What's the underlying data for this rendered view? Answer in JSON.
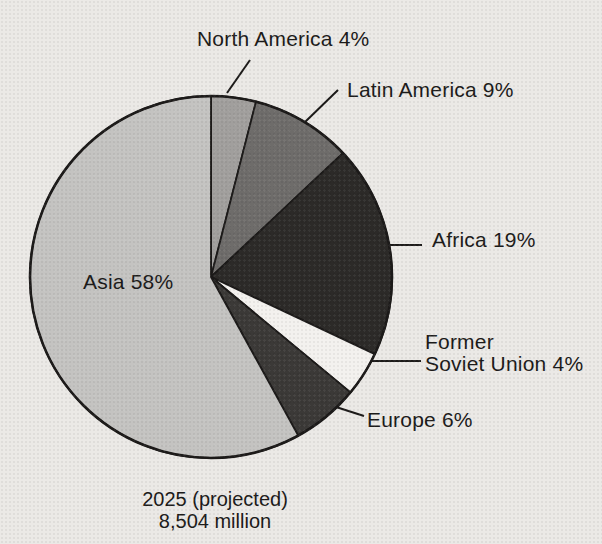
{
  "page": {
    "background_color": "#ebe9e6",
    "text_color": "#1b1a19"
  },
  "chart_data": {
    "type": "pie",
    "title": "",
    "caption_line1": "2025 (projected)",
    "caption_line2": "8,504 million",
    "year": 2025,
    "total_million": 8504,
    "direction": "clockwise",
    "start_angle_deg_from_top": 0,
    "stroke_color": "#1c1a19",
    "slices": [
      {
        "id": "north-america",
        "name": "North America",
        "value_pct": 4,
        "color": "#a19f9d",
        "label": "North America 4%"
      },
      {
        "id": "latin-america",
        "name": "Latin America",
        "value_pct": 9,
        "color": "#6e6c6a",
        "label": "Latin America 9%"
      },
      {
        "id": "africa",
        "name": "Africa",
        "value_pct": 19,
        "color": "#2c2a28",
        "label": "Africa 19%"
      },
      {
        "id": "former-soviet-union",
        "name": "Former Soviet Union",
        "value_pct": 4,
        "color": "#f3f1ee",
        "label_line1": "Former",
        "label_line2": "Soviet Union 4%"
      },
      {
        "id": "europe",
        "name": "Europe",
        "value_pct": 6,
        "color": "#3b3937",
        "label": "Europe 6%"
      },
      {
        "id": "asia",
        "name": "Asia",
        "value_pct": 58,
        "color": "#c4c3c1",
        "label": "Asia 58%"
      }
    ],
    "geometry": {
      "cx": 211,
      "cy": 277,
      "r": 181
    }
  }
}
